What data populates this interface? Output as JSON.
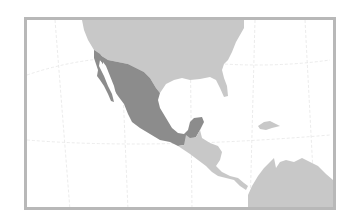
{
  "map": {
    "title": "Mexico locator map",
    "highlighted_country": "Mexico",
    "region": "North and Central America",
    "colors": {
      "background": "#ffffff",
      "frame": "#b8b8b8",
      "highlight": "#8c8c8c",
      "land": "#c8c8c8",
      "graticule": "#e6e6e6"
    },
    "features": [
      {
        "name": "United States",
        "style": "land"
      },
      {
        "name": "Mexico",
        "style": "highlight"
      },
      {
        "name": "Central America",
        "style": "land"
      },
      {
        "name": "Hispaniola",
        "style": "land"
      },
      {
        "name": "South America",
        "style": "land"
      }
    ]
  }
}
